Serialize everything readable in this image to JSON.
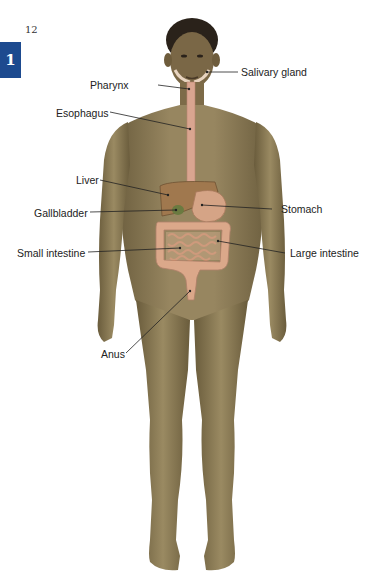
{
  "page": {
    "number": "12",
    "chapter_tab": "1",
    "chapter_tab_color": "#1d4a8f"
  },
  "figure": {
    "skin_color": "#8a7a55",
    "organ_color": "#d9a07e",
    "labels": {
      "salivary_gland": "Salivary gland",
      "pharynx": "Pharynx",
      "esophagus": "Esophagus",
      "liver": "Liver",
      "gallbladder": "Gallbladder",
      "stomach": "Stomach",
      "small_intestine": "Small intestine",
      "large_intestine": "Large intestine",
      "anus": "Anus"
    }
  }
}
